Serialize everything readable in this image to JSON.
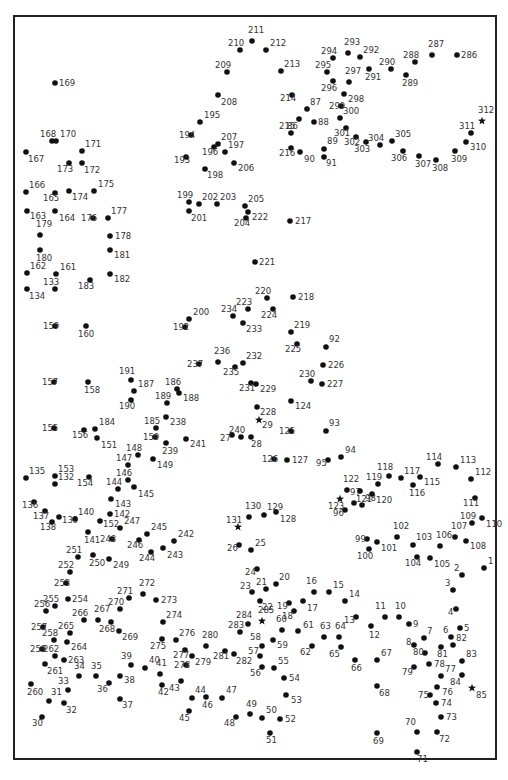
{
  "puzzle": {
    "type": "connect-the-dots",
    "total_points": 312,
    "dot_color": "#111111",
    "label_color": "#333333",
    "border_color": "#222222",
    "star_points": [
      29,
      85,
      123,
      131,
      285,
      312
    ],
    "start_point": 1,
    "end_point": 312
  }
}
